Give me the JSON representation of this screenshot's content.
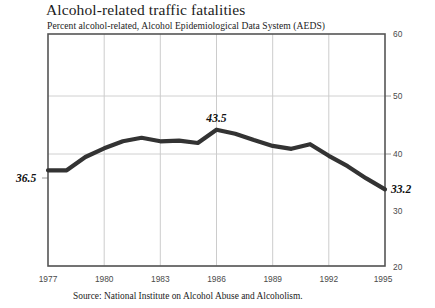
{
  "figure": {
    "title": "Alcohol-related traffic fatalities",
    "subtitle": "Percent alcohol-related, Alcohol Epidemiological Data System (AEDS)",
    "source": "Source: National Institute on Alcohol Abuse and Alcoholism."
  },
  "callouts": {
    "start_label": "36.5",
    "peak_label": "43.5",
    "end_label": "33.2"
  },
  "axis": {
    "y_ticks": [
      "60",
      "50",
      "40",
      "30",
      "20"
    ],
    "x_ticks": [
      "1977",
      "1980",
      "1983",
      "1986",
      "1989",
      "1992",
      "1995"
    ]
  },
  "colors": {
    "line": "#333333",
    "frame": "#555555",
    "grid": "#cfcfcf",
    "background": "#ffffff",
    "text": "#1c1c1c"
  },
  "chart_data": {
    "type": "line",
    "title": "Alcohol-related traffic fatalities",
    "subtitle": "Percent alcohol-related, Alcohol Epidemiological Data System (AEDS)",
    "xlabel": "",
    "ylabel": "Percent alcohol-related",
    "ylim": [
      20,
      60
    ],
    "xlim": [
      1977,
      1995
    ],
    "yticks": [
      20,
      30,
      40,
      50,
      60
    ],
    "xticks": [
      1977,
      1980,
      1983,
      1986,
      1989,
      1992,
      1995
    ],
    "grid": "both, light gray horizontal at 50 and 40 plus vertical at 1980/1983/1986/1989/1992",
    "legend": "none",
    "x": [
      1977,
      1978,
      1979,
      1980,
      1981,
      1982,
      1983,
      1984,
      1985,
      1986,
      1987,
      1988,
      1989,
      1990,
      1991,
      1992,
      1993,
      1994,
      1995
    ],
    "values": [
      36.5,
      36.5,
      38.8,
      40.3,
      41.5,
      42.1,
      41.5,
      41.6,
      41.2,
      43.5,
      42.8,
      41.7,
      40.7,
      40.2,
      41.0,
      39.0,
      37.2,
      35.1,
      33.2
    ],
    "series": [
      {
        "name": "Percent alcohol-related",
        "values": [
          36.5,
          36.5,
          38.8,
          40.3,
          41.5,
          42.1,
          41.5,
          41.6,
          41.2,
          43.5,
          42.8,
          41.7,
          40.7,
          40.2,
          41.0,
          39.0,
          37.2,
          35.1,
          33.2
        ]
      }
    ],
    "annotations": [
      {
        "text": "36.5",
        "x": 1977,
        "y": 36.5,
        "position": "left-of-axis"
      },
      {
        "text": "43.5",
        "x": 1986,
        "y": 43.5,
        "position": "above-point"
      },
      {
        "text": "33.2",
        "x": 1995,
        "y": 33.2,
        "position": "right-of-axis"
      }
    ]
  }
}
